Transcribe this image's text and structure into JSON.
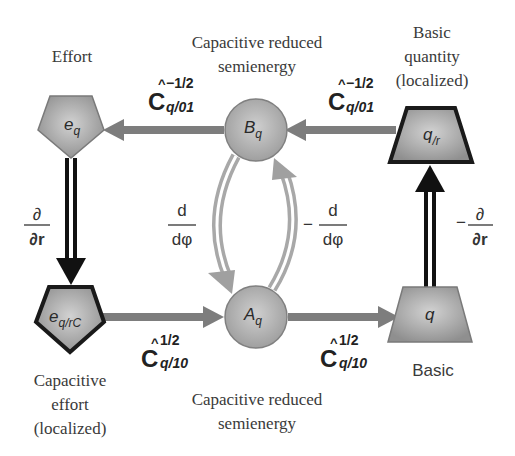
{
  "colors": {
    "node_fill": "#9a9a9a",
    "node_highlight": "#d0d0d0",
    "node_border_dark": "#1a1a1a",
    "node_border_light": "#7a7a7a",
    "arrow_gray": "#7d7d7d",
    "arrow_black": "#111111",
    "arrow_light": "#a8a8a8",
    "text": "#3a3a3a"
  },
  "nodes": {
    "effort": {
      "symbol": "e",
      "subscript": "q",
      "caption": [
        "Effort"
      ]
    },
    "capacitive_effort": {
      "symbol": "e",
      "subscript": "q/rC",
      "caption": [
        "Capacitive",
        "effort",
        "(localized)"
      ]
    },
    "B": {
      "symbol": "B",
      "subscript": "q",
      "caption": [
        "Capacitive reduced",
        "semienergy"
      ]
    },
    "A": {
      "symbol": "A",
      "subscript": "q",
      "caption": [
        "Capacitive reduced",
        "semienergy"
      ]
    },
    "basic_localized": {
      "symbol": "q",
      "subscript": "/r",
      "caption": [
        "Basic",
        "quantity",
        "(localized)"
      ]
    },
    "basic": {
      "symbol": "q",
      "subscript": "",
      "caption": [
        "Basic"
      ]
    }
  },
  "operators": {
    "top_left": {
      "base": "C",
      "hat": "^",
      "superscript": "−1/2",
      "subscript": "q/01"
    },
    "top_right": {
      "base": "C",
      "hat": "^",
      "superscript": "−1/2",
      "subscript": "q/01"
    },
    "bottom_left": {
      "base": "C",
      "hat": "^",
      "superscript": "1/2",
      "subscript": "q/10"
    },
    "bottom_right": {
      "base": "C",
      "hat": "^",
      "superscript": "1/2",
      "subscript": "q/10"
    },
    "left_derivative": {
      "sign": "",
      "numerator": "∂",
      "denominator": "∂r"
    },
    "right_derivative": {
      "sign": "−",
      "numerator": "∂",
      "denominator": "∂r"
    },
    "phi_down": {
      "sign": "",
      "numerator": "d",
      "denominator": "dφ"
    },
    "phi_up": {
      "sign": "−",
      "numerator": "d",
      "denominator": "dφ"
    }
  }
}
